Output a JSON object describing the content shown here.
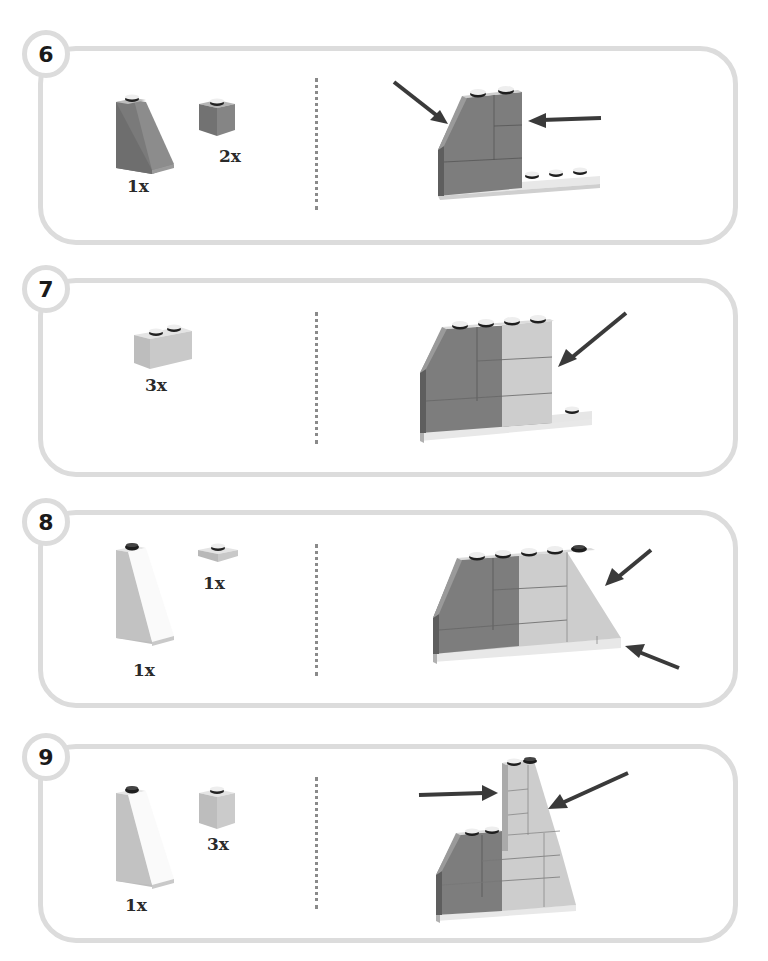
{
  "colors": {
    "panel_border": "#dcdcdc",
    "dark_gray_brick": "#7a7a7a",
    "light_gray_brick": "#c4c4c4",
    "white_brick": "#f2f2f2",
    "arrow": "#3a3a3a",
    "divider_dots": "#8a8a8a"
  },
  "steps": [
    {
      "number": "6",
      "parts": [
        {
          "shape": "slope-2x1x2",
          "color": "dark-gray",
          "quantity": "1x"
        },
        {
          "shape": "brick-1x1",
          "color": "dark-gray",
          "quantity": "2x"
        }
      ],
      "arrows": 2
    },
    {
      "number": "7",
      "parts": [
        {
          "shape": "brick-1x2",
          "color": "light-gray",
          "quantity": "3x"
        }
      ],
      "arrows": 1
    },
    {
      "number": "8",
      "parts": [
        {
          "shape": "slope-tall-1x2x3",
          "color": "light-gray",
          "quantity": "1x"
        },
        {
          "shape": "plate-1x1",
          "color": "light-gray",
          "quantity": "1x"
        }
      ],
      "arrows": 2
    },
    {
      "number": "9",
      "parts": [
        {
          "shape": "slope-tall-1x2x3",
          "color": "light-gray",
          "quantity": "1x"
        },
        {
          "shape": "brick-1x1",
          "color": "light-gray",
          "quantity": "3x"
        }
      ],
      "arrows": 2
    }
  ]
}
